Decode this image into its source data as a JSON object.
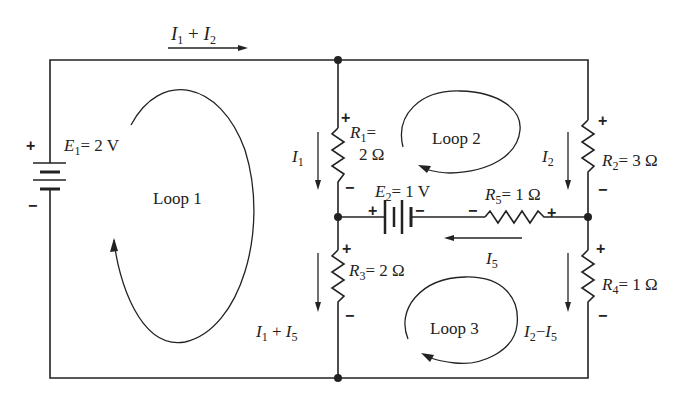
{
  "diagram": {
    "type": "circuit",
    "sources": [
      {
        "id": "E1",
        "name": "E",
        "sub": "1",
        "value": "= 2 V"
      },
      {
        "id": "E2",
        "name": "E",
        "sub": "2",
        "value": "= 1 V"
      }
    ],
    "resistors": [
      {
        "id": "R1",
        "name": "R",
        "sub": "1",
        "value_line1": "=",
        "value_line2": "2 Ω"
      },
      {
        "id": "R2",
        "name": "R",
        "sub": "2",
        "value": "= 3 Ω"
      },
      {
        "id": "R3",
        "name": "R",
        "sub": "3",
        "value": "= 2 Ω"
      },
      {
        "id": "R4",
        "name": "R",
        "sub": "4",
        "value": "= 1 Ω"
      },
      {
        "id": "R5",
        "name": "R",
        "sub": "5",
        "value": "= 1 Ω"
      }
    ],
    "currents": {
      "top": {
        "a": "I",
        "a_sub": "1",
        "op": " + ",
        "b": "I",
        "b_sub": "2"
      },
      "i1": {
        "a": "I",
        "a_sub": "1"
      },
      "i2": {
        "a": "I",
        "a_sub": "2"
      },
      "i5": {
        "a": "I",
        "a_sub": "5"
      },
      "r3": {
        "a": "I",
        "a_sub": "1",
        "op": " + ",
        "b": "I",
        "b_sub": "5"
      },
      "r4": {
        "a": "I",
        "a_sub": "2",
        "op": "−",
        "b": "I",
        "b_sub": "5"
      }
    },
    "loops": [
      "Loop 1",
      "Loop 2",
      "Loop 3"
    ],
    "polarity": {
      "plus": "+",
      "minus": "−"
    }
  }
}
